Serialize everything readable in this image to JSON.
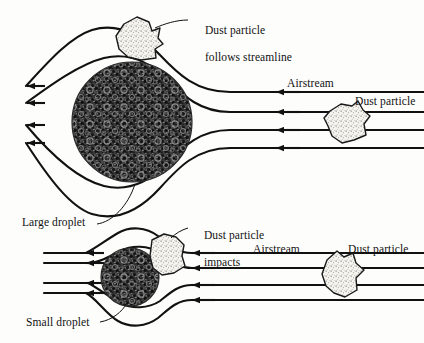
{
  "figure": {
    "background_color": "#fdfdfc",
    "ink_color": "#111111",
    "droplet_fill": "#2f2f2f",
    "particle_fill": "#f2f1ec"
  },
  "labels": {
    "top_particle_line1": "Dust particle",
    "top_particle_line2": "follows streamline",
    "airstream_top": "Airstream",
    "dust_particle_top_right": "Dust particle",
    "large_droplet": "Large droplet",
    "impacts_line1": "Dust particle",
    "impacts_line2": "impacts",
    "airstream_bottom": "Airstream",
    "dust_particle_bottom_right": "Dust particle",
    "small_droplet": "Small droplet"
  },
  "panels": [
    {
      "name": "large-droplet-panel",
      "droplet": {
        "type": "large",
        "center_x": 132,
        "center_y": 122,
        "radius": 60,
        "label": "Large droplet",
        "texture": "stipple-dark"
      },
      "airstream_label": "Airstream",
      "particles": [
        {
          "name": "deflected-particle",
          "center_x": 139,
          "center_y": 39,
          "state": "follows streamline",
          "label": "Dust particle follows streamline"
        },
        {
          "name": "incoming-particle",
          "center_x": 345,
          "center_y": 124,
          "state": "incoming",
          "label": "Dust particle"
        }
      ],
      "streamlines": {
        "count": 4,
        "direction": "right-to-left",
        "behavior": "deflected around droplet",
        "inlet_y": [
          92,
          112,
          130,
          148
        ],
        "outlet_y": [
          86,
          103,
          125,
          143
        ]
      }
    },
    {
      "name": "small-droplet-panel",
      "droplet": {
        "type": "small",
        "center_x": 130,
        "center_y": 277,
        "radius": 29,
        "label": "Small droplet",
        "texture": "stipple-dark"
      },
      "airstream_label": "Airstream",
      "particles": [
        {
          "name": "impacting-particle",
          "center_x": 168,
          "center_y": 256,
          "state": "impacts",
          "label": "Dust particle impacts"
        },
        {
          "name": "incoming-particle",
          "center_x": 340,
          "center_y": 277,
          "state": "incoming",
          "label": "Dust particle"
        }
      ],
      "streamlines": {
        "count": 4,
        "direction": "right-to-left",
        "behavior": "deflected around droplet",
        "inlet_y": [
          253,
          268,
          285,
          300
        ],
        "outlet_y": [
          253,
          263,
          283,
          293
        ]
      }
    }
  ]
}
